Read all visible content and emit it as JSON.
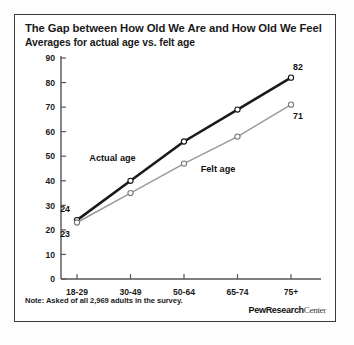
{
  "card": {
    "title": "The Gap between How Old We Are and How Old We Feel",
    "subtitle": "Averages for actual age vs. felt age",
    "note": "Note: Asked of all 2,969 adults in the survey.",
    "brand_bold": "PewResearch",
    "brand_light": "Center"
  },
  "chart_data": {
    "type": "line",
    "title": "The Gap between How Old We Are and How Old We Feel",
    "subtitle": "Averages for actual age vs. felt age",
    "xlabel": "",
    "ylabel": "",
    "categories": [
      "18-29",
      "30-49",
      "50-64",
      "65-74",
      "75+"
    ],
    "yticks": [
      0,
      10,
      20,
      30,
      40,
      50,
      60,
      70,
      80,
      90
    ],
    "ylim": [
      0,
      90
    ],
    "grid": false,
    "legend": "inline-annotations",
    "series": [
      {
        "name": "Actual age",
        "color": "#1a1a1a",
        "values": [
          24,
          40,
          56,
          69,
          82
        ],
        "point_labels": {
          "0": "24",
          "4": "82"
        }
      },
      {
        "name": "Felt age",
        "color": "#9a9a9a",
        "values": [
          23,
          35,
          47,
          58,
          71
        ],
        "point_labels": {
          "0": "23",
          "4": "71"
        }
      }
    ],
    "annotations": [
      {
        "text": "Actual age",
        "series": "Actual age"
      },
      {
        "text": "Felt age",
        "series": "Felt age"
      },
      {
        "text": "24",
        "value": 24
      },
      {
        "text": "23",
        "value": 23
      },
      {
        "text": "82",
        "value": 82
      },
      {
        "text": "71",
        "value": 71
      }
    ]
  }
}
